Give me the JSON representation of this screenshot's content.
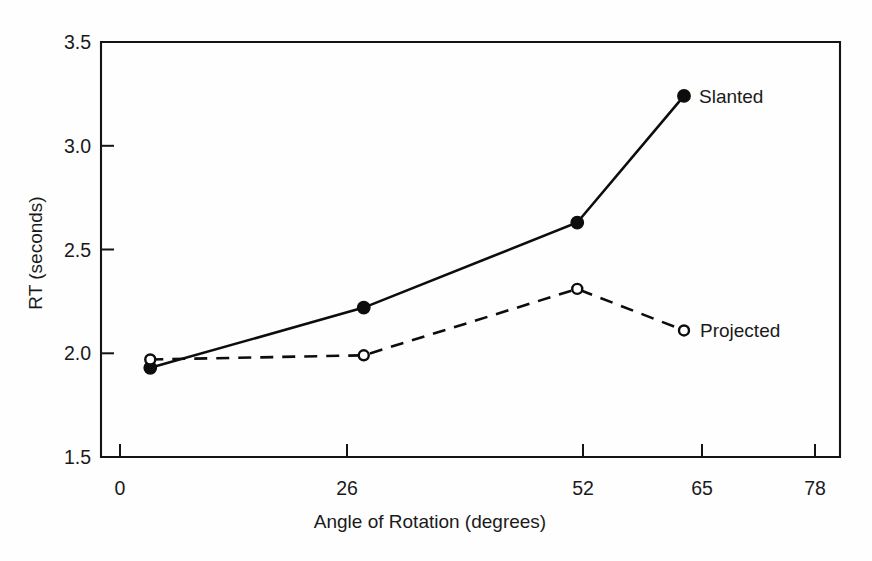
{
  "chart_data": {
    "type": "line",
    "title": "",
    "xlabel": "Angle of Rotation (degrees)",
    "ylabel": "RT (seconds)",
    "x": [
      0,
      26,
      52,
      65
    ],
    "xtick_labels": [
      "0",
      "26",
      "52",
      "65",
      "78"
    ],
    "xtick_values": [
      0,
      26,
      52,
      65,
      78
    ],
    "ytick_labels": [
      "1.5",
      "2.0",
      "2.5",
      "3.0",
      "3.5"
    ],
    "ytick_values": [
      1.5,
      2.0,
      2.5,
      3.0,
      3.5
    ],
    "xlim": [
      -6,
      84
    ],
    "ylim": [
      1.5,
      3.5
    ],
    "grid": false,
    "legend_position": "inline-right-of-last-point",
    "series": [
      {
        "name": "Slanted",
        "values": [
          1.93,
          2.22,
          2.63,
          3.24
        ],
        "line_style": "solid",
        "marker": "filled-circle",
        "color": "#0d0d0d"
      },
      {
        "name": "Projected",
        "values": [
          1.97,
          1.99,
          2.31,
          2.11
        ],
        "line_style": "dashed",
        "marker": "open-circle",
        "color": "#0d0d0d"
      }
    ],
    "annotations": [
      {
        "text": "Slanted",
        "at_x": 65,
        "at_y": 3.24
      },
      {
        "text": "Projected",
        "at_x": 65,
        "at_y": 2.11
      }
    ]
  },
  "figure": {
    "background_color": "#fefefe",
    "axis_color": "#141414",
    "series_color": "#0d0d0d"
  }
}
